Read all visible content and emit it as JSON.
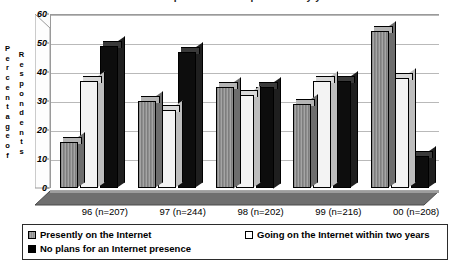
{
  "chart_data": {
    "type": "bar",
    "title": "Internet presence of respondents by year",
    "xlabel": "",
    "ylabel": "Percentage of Respondents",
    "ylim": [
      0,
      60
    ],
    "yticks": [
      0,
      10,
      20,
      30,
      40,
      50,
      60
    ],
    "grid": true,
    "legend_position": "bottom",
    "categories": [
      "96 (n=207)",
      "97 (n=244)",
      "98 (n=202)",
      "99 (n=216)",
      "00 (n=208)"
    ],
    "series": [
      {
        "name": "Presently on the Internet",
        "color": "#8d8d8d",
        "values": [
          16,
          30,
          35,
          29,
          54
        ]
      },
      {
        "name": "Going on the Internet within two years",
        "color": "#f3f3f3",
        "values": [
          37,
          27,
          32,
          37,
          38
        ]
      },
      {
        "name": "No plans for an Internet presence",
        "color": "#0d0d0d",
        "values": [
          49,
          47,
          35,
          37,
          11
        ]
      }
    ]
  },
  "axis": {
    "y_title_left": [
      "P",
      "e",
      "r",
      "c",
      "e",
      "n",
      "t",
      "a",
      "g",
      "e",
      "o",
      "f"
    ],
    "y_title_right": [
      "R",
      "e",
      "s",
      "p",
      "o",
      "n",
      "d",
      "e",
      "n",
      "t",
      "s"
    ]
  },
  "colors": {
    "gray": "#8d8d8d",
    "white": "#f3f3f3",
    "black": "#0d0d0d",
    "gridline": "#b9b9b9",
    "axis": "#9a9a9a"
  }
}
